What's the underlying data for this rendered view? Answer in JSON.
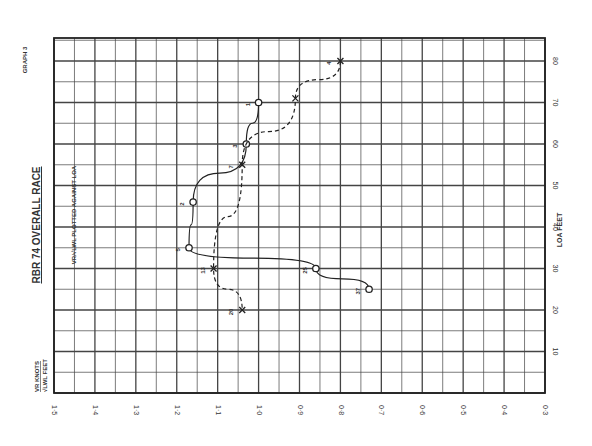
{
  "graph_label": "GRAPH 3",
  "title": "RBR 74 OVERALL RACE",
  "subtitle": {
    "fraction_top": "VR",
    "fraction_bottom": "√LWL",
    "text": "PLOTTED AGAINST LOA"
  },
  "x_axis_label": {
    "top": "VR KNOTS",
    "bottom": "√LWL FEET"
  },
  "y_axis_label": "LOA FEET",
  "chart_data": {
    "type": "line",
    "title": "RBR 74 OVERALL RACE",
    "subtitle": "VR/√LWL plotted against LOA",
    "orientation": "rotated: value axis horizontal (decreasing left→right), LOA axis vertical",
    "xlabel": "VR KNOTS / √LWL FEET",
    "ylabel": "LOA FEET",
    "value_ticks": [
      "1·5",
      "1·4",
      "1·3",
      "1·2",
      "1·1",
      "1·0",
      "0·9",
      "0·8",
      "0·7",
      "0·6",
      "0·5",
      "0·4",
      "0·3"
    ],
    "loa_ticks": [
      "0",
      "10",
      "20",
      "30",
      "40",
      "50",
      "60",
      "70",
      "80"
    ],
    "value_range": [
      1.5,
      0.3
    ],
    "loa_range": [
      0,
      85
    ],
    "grid": true,
    "series": [
      {
        "name": "solid",
        "style": "solid",
        "marker": "circle",
        "points": [
          {
            "label": "1",
            "loa": 70,
            "value": 1.0
          },
          {
            "label": "3",
            "loa": 60,
            "value": 1.03
          },
          {
            "label": "2",
            "loa": 46,
            "value": 1.16
          },
          {
            "label": "5",
            "loa": 35,
            "value": 1.17
          },
          {
            "label": "25",
            "loa": 30,
            "value": 0.86
          },
          {
            "label": "37",
            "loa": 25,
            "value": 0.73
          }
        ]
      },
      {
        "name": "dashed",
        "style": "dashed",
        "marker": "cross",
        "points": [
          {
            "label": "4",
            "loa": 80,
            "value": 0.8
          },
          {
            "label": "",
            "loa": 71,
            "value": 0.91
          },
          {
            "label": "7",
            "loa": 55,
            "value": 1.04
          },
          {
            "label": "13",
            "loa": 30,
            "value": 1.11
          },
          {
            "label": "20",
            "loa": 20,
            "value": 1.04
          }
        ]
      }
    ]
  }
}
